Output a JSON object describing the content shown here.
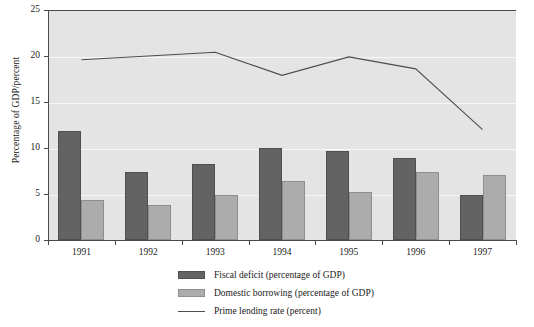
{
  "chart_data": {
    "type": "bar",
    "title": "",
    "xlabel": "",
    "ylabel": "Percentage of GDP/percent",
    "categories": [
      "1991",
      "1992",
      "1993",
      "1994",
      "1995",
      "1996",
      "1997"
    ],
    "ylim": [
      0,
      25
    ],
    "yticks": [
      0,
      5,
      10,
      15,
      20,
      25
    ],
    "grid": true,
    "legend_position": "bottom-center",
    "series": [
      {
        "name": "Fiscal deficit (percentage of GDP)",
        "type": "bar",
        "color": "#636363",
        "values": [
          11.8,
          7.4,
          8.3,
          10.0,
          9.7,
          8.9,
          4.9
        ]
      },
      {
        "name": "Domestic borrowing (percentage of GDP)",
        "type": "bar",
        "color": "#acacac",
        "values": [
          4.4,
          3.8,
          4.9,
          6.4,
          5.2,
          7.4,
          7.1
        ]
      },
      {
        "name": "Prime lending rate (percent)",
        "type": "line",
        "color": "#4d4d4d",
        "values": [
          19.6,
          20.0,
          20.4,
          17.9,
          19.9,
          18.6,
          12.0
        ]
      }
    ]
  },
  "legend": {
    "items": [
      {
        "label": "Fiscal deficit (percentage of GDP)",
        "marker": "dark-swatch"
      },
      {
        "label": "Domestic borrowing (percentage of GDP)",
        "marker": "light-swatch"
      },
      {
        "label": "Prime lending rate (percent)",
        "marker": "line-swatch"
      }
    ]
  },
  "axes": {
    "y_title": "Percentage of GDP/percent",
    "y_tick_labels": [
      "0",
      "5",
      "10",
      "15",
      "20",
      "25"
    ],
    "x_tick_labels": [
      "1991",
      "1992",
      "1993",
      "1994",
      "1995",
      "1996",
      "1997"
    ]
  }
}
